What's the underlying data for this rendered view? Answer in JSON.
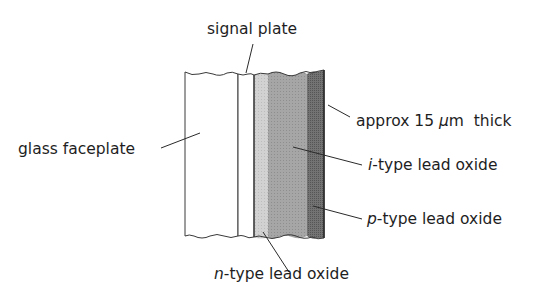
{
  "diagram": {
    "colors": {
      "outline": "#3a3a3a",
      "glass": "#ffffff",
      "signal_plate": "#ffffff",
      "n_type": "#cfcfcf",
      "i_type": "#a4a4a4",
      "p_type": "#6e6e6e",
      "text": "#1e1e1e"
    },
    "layers": [
      {
        "id": "glass-faceplate",
        "label": "glass faceplate"
      },
      {
        "id": "signal-plate",
        "label": "signal plate"
      },
      {
        "id": "n-type",
        "prefix": "n",
        "label": "-type lead oxide"
      },
      {
        "id": "i-type",
        "prefix": "i",
        "label": "-type lead oxide"
      },
      {
        "id": "p-type",
        "prefix": "p",
        "label": "-type lead oxide"
      }
    ],
    "thickness_annotation": {
      "prefix": "approx 15 ",
      "unit_symbol": "μ",
      "suffix": "m  thick"
    }
  }
}
